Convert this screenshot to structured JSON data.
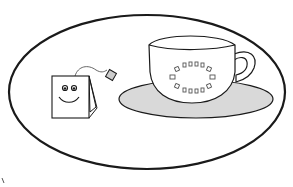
{
  "image": {
    "description": "Line drawing of a smiling tea bag next to a teacup on a saucer, inside an oval frame",
    "colors": {
      "background": "#ffffff",
      "stroke": "#1a1a1a",
      "saucer_fill": "#d9d9d9",
      "cup_fill": "#ffffff"
    },
    "elements": [
      "oval-frame",
      "tea-bag",
      "tea-bag-tag",
      "teacup",
      "cup-handle",
      "saucer",
      "cup-pattern"
    ]
  }
}
